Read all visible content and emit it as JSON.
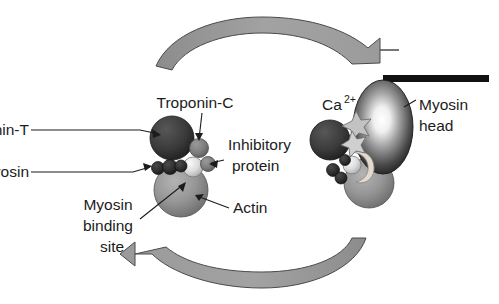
{
  "diagram": {
    "background_color": "#ffffff",
    "text_color": "#1c1c1c"
  },
  "labels": {
    "troponin_t": "Troponin-T",
    "troponin_c": "Troponin-C",
    "tropomyosin": "Tropomyosin",
    "inhibitory_protein_line1": "Inhibitory",
    "inhibitory_protein_line2": "protein",
    "myosin_binding_site_line1": "Myosin",
    "myosin_binding_site_line2": "binding",
    "myosin_binding_site_line3": "site",
    "actin": "Actin",
    "calcium_ion_base": "Ca",
    "calcium_ion_charge": "2+",
    "myosin_head_line1": "Myosin",
    "myosin_head_line2": "head"
  },
  "shapes": {
    "troponin_t": {
      "name": "troponin-t-sphere",
      "color": "#3b3b3b"
    },
    "troponin_c": {
      "name": "troponin-c-sphere",
      "color": "#7d7d7d"
    },
    "inhibitory_protein": {
      "name": "inhibitory-protein-sphere",
      "color": "#d9d9d9"
    },
    "tropomyosin": {
      "name": "tropomyosin-strand",
      "color": "#2e2e2e"
    },
    "actin": {
      "name": "actin-sphere",
      "color": "#949494"
    },
    "myosin_head": {
      "name": "myosin-head-ellipse",
      "color": "#2b2b2b",
      "highlight": "#ffffff"
    },
    "myosin_tail": {
      "name": "myosin-tail-rod",
      "color": "#111111"
    },
    "calcium_star": {
      "name": "calcium-ion-star",
      "color": "#b5b5b5"
    },
    "arrows": {
      "name": "cycle-arrow",
      "fill": "#9a9a9a",
      "stroke": "#4a4a4a"
    }
  },
  "arrows": {
    "top": {
      "label": "top-cycle-arrow",
      "direction": "left-to-right"
    },
    "bottom": {
      "label": "bottom-cycle-arrow",
      "direction": "right-to-left"
    }
  }
}
